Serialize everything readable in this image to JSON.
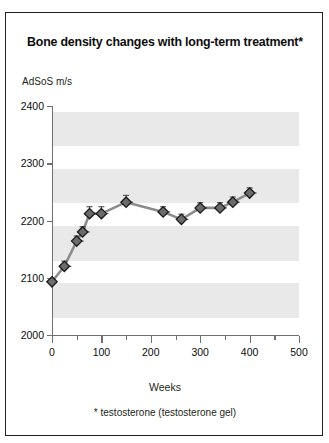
{
  "figure": {
    "title": "Bone density changes with long-term treatment*",
    "footnote": "* testosterone (testosterone gel)"
  },
  "chart_data": {
    "type": "line",
    "title": "Bone density changes with long-term treatment*",
    "subtitle": "",
    "xlabel": "Weeks",
    "ylabel": "AdSoS m/s",
    "ylabel_position": "above-axis",
    "xlim": [
      0,
      500
    ],
    "ylim": [
      2000,
      2400
    ],
    "xticks": [
      0,
      100,
      200,
      300,
      400,
      500
    ],
    "xticks_minor": [
      50,
      150,
      250,
      350,
      450
    ],
    "yticks": [
      2000,
      2100,
      2200,
      2300,
      2400
    ],
    "xtick_labels": [
      "0",
      "100",
      "200",
      "300",
      "400",
      "500"
    ],
    "ytick_labels": [
      "2000",
      "2100",
      "2200",
      "2300",
      "2400"
    ],
    "grid": false,
    "banding": "alternating horizontal grey bands",
    "legend": null,
    "marker": "diamond",
    "marker_color": "#6b6b6b",
    "marker_edge_color": "#1a1a1a",
    "line_color": "#8c8c8c",
    "errorbars": true,
    "series": [
      {
        "name": "AdSoS m/s",
        "x": [
          0,
          25,
          50,
          62,
          76,
          100,
          150,
          225,
          262,
          300,
          340,
          366,
          400
        ],
        "values": [
          2093,
          2120,
          2164,
          2180,
          2212,
          2212,
          2232,
          2215,
          2202,
          2222,
          2222,
          2232,
          2248
        ],
        "errors": [
          0,
          9,
          9,
          9,
          12,
          12,
          12,
          9,
          9,
          9,
          9,
          9,
          9
        ]
      }
    ]
  },
  "annotations": {
    "title_asterisk": "*"
  }
}
